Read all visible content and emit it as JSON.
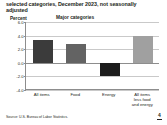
{
  "slide": {
    "title_line_1": "selected categories, December 2023, not seasonally",
    "title_line_2": "adjusted",
    "subtitle": "Major categories",
    "source": "Source: U.S. Bureau of Labor Statistics.",
    "page_number": "4"
  },
  "chart_data": {
    "type": "bar",
    "title": "selected categories, December 2023, not seasonally adjusted",
    "subtitle": "Major categories",
    "xlabel": "",
    "ylabel": "Percent",
    "ylim": [
      -4.0,
      6.0
    ],
    "yticks": [
      "6.0",
      "4.0",
      "2.0",
      "0.0",
      "-2.0",
      "-4.0"
    ],
    "ytick_values": [
      6.0,
      4.0,
      2.0,
      0.0,
      -2.0,
      -4.0
    ],
    "grid": true,
    "legend": "none",
    "categories": [
      "All items",
      "Food",
      "Energy",
      "All items less food and energy"
    ],
    "category_label_lines": [
      [
        "All items"
      ],
      [
        "Food"
      ],
      [
        "Energy"
      ],
      [
        "All items",
        "less food",
        "and energy"
      ]
    ],
    "values": [
      3.4,
      2.7,
      -2.0,
      3.9
    ],
    "colors": [
      "#3b3b3b",
      "#636363",
      "#1c1c1c",
      "#a0a0a0"
    ],
    "series": [
      {
        "name": "12-month percent change",
        "values": [
          3.4,
          2.7,
          -2.0,
          3.9
        ]
      }
    ]
  }
}
